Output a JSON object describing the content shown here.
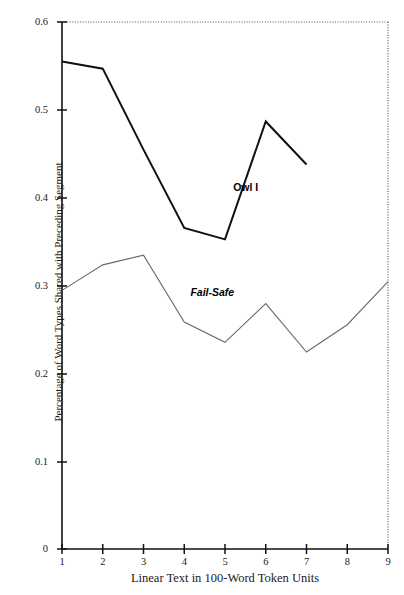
{
  "chart": {
    "type": "line",
    "title": "",
    "xlabel": "Linear Text in 100-Word Token Units",
    "ylabel": "Percentage of Word Types Shared with Preceding Segment",
    "xlim": [
      1,
      9
    ],
    "ylim": [
      0,
      0.6
    ],
    "xticks": [
      "1",
      "2",
      "3",
      "4",
      "5",
      "6",
      "7",
      "8",
      "9"
    ],
    "yticks": [
      "0",
      "0.1",
      "0.2",
      "0.3",
      "0.4",
      "0.5",
      "0.6"
    ],
    "grid": false,
    "legend_position": "inline-annotation",
    "frame": "top-and-right-dotted",
    "colors": {
      "owl_i": "#111111",
      "fail_safe": "#6a6a6a",
      "axis": "#111111"
    }
  },
  "chart_data": {
    "type": "line",
    "title": "",
    "xlabel": "Linear Text in 100-Word Token Units",
    "ylabel": "Percentage of Word Types Shared with Preceding Segment",
    "x": [
      1,
      2,
      3,
      4,
      5,
      6,
      7,
      8,
      9
    ],
    "xlim": [
      1,
      9
    ],
    "ylim": [
      0,
      0.6
    ],
    "grid": false,
    "legend_position": "inline-annotation",
    "series": [
      {
        "name": "Owl I",
        "x": [
          1,
          2,
          3,
          4,
          5,
          6,
          7
        ],
        "values": [
          0.555,
          0.547,
          0.455,
          0.366,
          0.353,
          0.487,
          0.438
        ],
        "color": "#111111",
        "linewidth": 2.0,
        "label_position": {
          "x": 5.2,
          "y": 0.413
        }
      },
      {
        "name": "Fail-Safe",
        "x": [
          1,
          2,
          3,
          4,
          5,
          6,
          7,
          8,
          9
        ],
        "values": [
          0.295,
          0.324,
          0.335,
          0.259,
          0.236,
          0.28,
          0.225,
          0.256,
          0.305
        ],
        "color": "#6a6a6a",
        "linewidth": 1.1,
        "label_position": {
          "x": 4.15,
          "y": 0.293
        }
      }
    ],
    "annotations": [
      {
        "text": "Owl I",
        "x": 5.2,
        "y": 0.413,
        "style": "bold"
      },
      {
        "text": "Fail-Safe",
        "x": 4.15,
        "y": 0.293,
        "style": "bold-italic"
      }
    ]
  },
  "axes": {
    "y_tick_labels": [
      {
        "value": "0.6",
        "top": 17
      },
      {
        "value": "0.5",
        "top": 105
      },
      {
        "value": "0.4",
        "top": 193
      },
      {
        "value": "0.3",
        "top": 281
      },
      {
        "value": "0.2",
        "top": 369
      },
      {
        "value": "0.1",
        "top": 457
      },
      {
        "value": "0",
        "top": 544
      }
    ],
    "x_tick_labels": [
      {
        "value": "1",
        "left": 62
      },
      {
        "value": "2",
        "left": 102.75
      },
      {
        "value": "3",
        "left": 143.5
      },
      {
        "value": "4",
        "left": 184.25
      },
      {
        "value": "5",
        "left": 225
      },
      {
        "value": "6",
        "left": 265.75
      },
      {
        "value": "7",
        "left": 306.5
      },
      {
        "value": "8",
        "left": 347.25
      },
      {
        "value": "9",
        "left": 388
      }
    ]
  }
}
